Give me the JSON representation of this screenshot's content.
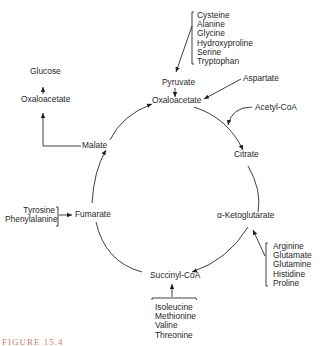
{
  "diagram": {
    "cycle_nodes": {
      "oxaloacetate": "Oxaloacetate",
      "citrate": "Citrate",
      "alpha_ketoglutarate": "α-Ketoglutarate",
      "succinyl_coa": "Succinyl-CoA",
      "fumarate": "Fumarate",
      "malate": "Malate"
    },
    "side_nodes": {
      "pyruvate": "Pyruvate",
      "aspartate": "Aspartate",
      "acetyl_coa": "Acetyl-CoA",
      "glucose": "Glucose",
      "oxaloacetate_gluconeogenesis": "Oxaloacetate"
    },
    "groups": {
      "pyruvate_sources": [
        "Cysteine",
        "Alanine",
        "Glycine",
        "Hydroxyproline",
        "Serine",
        "Tryptophan"
      ],
      "akg_sources": [
        "Arginine",
        "Glutamate",
        "Glutamine",
        "Histidine",
        "Proline"
      ],
      "succinyl_sources": [
        "Isoleucine",
        "Methionine",
        "Valine",
        "Threonine"
      ],
      "fumarate_sources": [
        "Tyrosine",
        "Phenylalanine"
      ]
    },
    "caption": "FIGURE 15.4"
  }
}
